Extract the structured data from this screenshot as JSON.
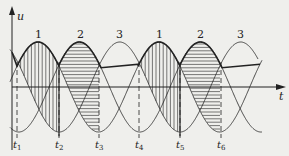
{
  "figure": {
    "axes": {
      "y_label": "u",
      "x_label": "t"
    },
    "phase_labels": [
      {
        "text": "1",
        "x": 38
      },
      {
        "text": "2",
        "x": 80
      },
      {
        "text": "3",
        "x": 119
      },
      {
        "text": "1",
        "x": 159
      },
      {
        "text": "2",
        "x": 200
      },
      {
        "text": "3",
        "x": 240
      }
    ],
    "time_marks": [
      {
        "label": "t",
        "sub": "1",
        "x": 17
      },
      {
        "label": "t",
        "sub": "2",
        "x": 59
      },
      {
        "label": "t",
        "sub": "3",
        "x": 99
      },
      {
        "label": "t",
        "sub": "4",
        "x": 139
      },
      {
        "label": "t",
        "sub": "5",
        "x": 180
      },
      {
        "label": "t",
        "sub": "6",
        "x": 221
      }
    ],
    "colors": {
      "ink": "#222222",
      "background": "#efefec"
    }
  }
}
